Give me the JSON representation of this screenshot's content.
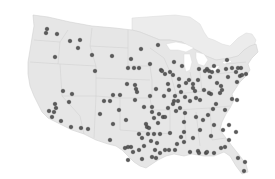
{
  "map": {
    "type": "point-map",
    "region": "Contiguous United States",
    "colors": {
      "land": "#e6e6e6",
      "canada": "#ececec",
      "borders": "#cfcfcf",
      "marker_fill": "#5a5a5a",
      "marker_stroke": "#3a3a3a",
      "background": "#ffffff"
    },
    "marker_radius": 1.8,
    "points": [
      [
        47,
        29
      ],
      [
        46,
        33
      ],
      [
        57,
        34
      ],
      [
        70,
        41
      ],
      [
        80,
        40
      ],
      [
        78,
        48
      ],
      [
        55,
        57
      ],
      [
        92,
        55
      ],
      [
        95,
        71
      ],
      [
        112,
        56
      ],
      [
        131,
        59
      ],
      [
        134,
        68
      ],
      [
        128,
        68
      ],
      [
        127,
        84
      ],
      [
        135,
        85
      ],
      [
        136,
        89
      ],
      [
        137,
        92
      ],
      [
        135,
        100
      ],
      [
        150,
        64
      ],
      [
        161,
        70
      ],
      [
        156,
        89
      ],
      [
        162,
        71
      ],
      [
        139,
        68
      ],
      [
        164,
        96
      ],
      [
        168,
        108
      ],
      [
        159,
        114
      ],
      [
        163,
        117
      ],
      [
        141,
        49
      ],
      [
        158,
        45
      ],
      [
        174,
        62
      ],
      [
        182,
        66
      ],
      [
        179,
        79
      ],
      [
        165,
        74
      ],
      [
        170,
        72
      ],
      [
        173,
        75
      ],
      [
        168,
        84
      ],
      [
        179,
        86
      ],
      [
        186,
        83
      ],
      [
        189,
        80
      ],
      [
        193,
        84
      ],
      [
        198,
        80
      ],
      [
        199,
        69
      ],
      [
        207,
        69
      ],
      [
        209,
        71
      ],
      [
        210,
        77
      ],
      [
        205,
        71
      ],
      [
        212,
        72
      ],
      [
        214,
        66
      ],
      [
        218,
        71
      ],
      [
        226,
        69
      ],
      [
        227,
        60
      ],
      [
        232,
        68
      ],
      [
        238,
        68
      ],
      [
        241,
        68
      ],
      [
        236,
        72
      ],
      [
        237,
        82
      ],
      [
        228,
        77
      ],
      [
        240,
        76
      ],
      [
        242,
        75
      ],
      [
        246,
        74
      ],
      [
        217,
        83
      ],
      [
        221,
        86
      ],
      [
        220,
        93
      ],
      [
        211,
        94
      ],
      [
        204,
        90
      ],
      [
        195,
        91
      ],
      [
        193,
        88
      ],
      [
        185,
        97
      ],
      [
        181,
        92
      ],
      [
        175,
        96
      ],
      [
        169,
        90
      ],
      [
        174,
        101
      ],
      [
        178,
        101
      ],
      [
        190,
        101
      ],
      [
        196,
        98
      ],
      [
        200,
        100
      ],
      [
        209,
        93
      ],
      [
        222,
        90
      ],
      [
        232,
        99
      ],
      [
        237,
        100
      ],
      [
        225,
        110
      ],
      [
        216,
        104
      ],
      [
        213,
        109
      ],
      [
        208,
        115
      ],
      [
        203,
        120
      ],
      [
        196,
        117
      ],
      [
        185,
        113
      ],
      [
        180,
        108
      ],
      [
        173,
        104
      ],
      [
        176,
        111
      ],
      [
        184,
        122
      ],
      [
        184,
        132
      ],
      [
        170,
        133
      ],
      [
        160,
        134
      ],
      [
        154,
        134
      ],
      [
        148,
        134
      ],
      [
        142,
        138
      ],
      [
        139,
        134
      ],
      [
        154,
        118
      ],
      [
        158,
        123
      ],
      [
        165,
        117
      ],
      [
        146,
        124
      ],
      [
        147,
        127
      ],
      [
        149,
        128
      ],
      [
        181,
        137
      ],
      [
        193,
        138
      ],
      [
        184,
        142
      ],
      [
        177,
        144
      ],
      [
        175,
        150
      ],
      [
        169,
        150
      ],
      [
        165,
        150
      ],
      [
        160,
        153
      ],
      [
        152,
        157
      ],
      [
        131,
        147
      ],
      [
        151,
        141
      ],
      [
        190,
        152
      ],
      [
        198,
        151
      ],
      [
        199,
        153
      ],
      [
        206,
        153
      ],
      [
        207,
        152
      ],
      [
        214,
        153
      ],
      [
        221,
        148
      ],
      [
        229,
        140
      ],
      [
        225,
        147
      ],
      [
        236,
        132
      ],
      [
        238,
        158
      ],
      [
        245,
        162
      ],
      [
        244,
        171
      ],
      [
        211,
        136
      ],
      [
        223,
        130
      ],
      [
        229,
        125
      ],
      [
        214,
        125
      ],
      [
        200,
        130
      ],
      [
        155,
        150
      ],
      [
        157,
        143
      ],
      [
        144,
        146
      ],
      [
        156,
        158
      ],
      [
        142,
        159
      ],
      [
        128,
        147
      ],
      [
        152,
        112
      ],
      [
        152,
        107
      ],
      [
        144,
        107
      ],
      [
        110,
        101
      ],
      [
        63,
        91
      ],
      [
        72,
        94
      ],
      [
        69,
        102
      ],
      [
        55,
        104
      ],
      [
        56,
        108
      ],
      [
        49,
        111
      ],
      [
        52,
        117
      ],
      [
        61,
        121
      ],
      [
        54,
        112
      ],
      [
        71,
        127
      ],
      [
        81,
        128
      ],
      [
        104,
        101
      ],
      [
        88,
        129
      ],
      [
        100,
        114
      ],
      [
        119,
        110
      ],
      [
        126,
        120
      ],
      [
        113,
        124
      ],
      [
        110,
        140
      ],
      [
        125,
        148
      ],
      [
        133,
        152
      ],
      [
        139,
        150
      ],
      [
        128,
        160
      ],
      [
        150,
        96
      ],
      [
        113,
        95
      ],
      [
        120,
        95
      ]
    ]
  }
}
